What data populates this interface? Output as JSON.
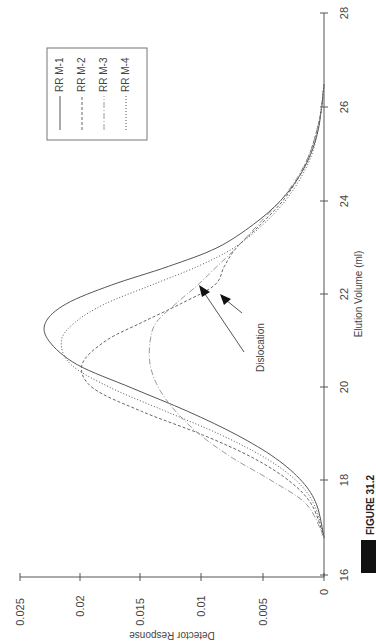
{
  "figure": {
    "caption_label": "FIGURE 31.2"
  },
  "chart_data": {
    "type": "line",
    "orientation": "rotated-90-clockwise",
    "title": "",
    "xlabel": "Elution Volume (ml)",
    "ylabel": "Detector Response",
    "xlim": [
      16,
      28
    ],
    "ylim": [
      0,
      0.025
    ],
    "x_ticks": [
      "16",
      "18",
      "20",
      "22",
      "24",
      "26",
      "28"
    ],
    "y_ticks": [
      "0",
      "0.005",
      "0.01",
      "0.015",
      "0.02",
      "0.025"
    ],
    "grid": false,
    "legend_position": "upper-right (rotated view: top-left box)",
    "legend": [
      "RR M-1",
      "RR M-2",
      "RR M-3",
      "RR M-4"
    ],
    "x": [
      16.8,
      17.5,
      18.0,
      18.5,
      19.0,
      19.5,
      20.0,
      20.5,
      21.0,
      21.4,
      21.8,
      22.2,
      22.6,
      23.0,
      23.5,
      24.0,
      24.5,
      25.0,
      25.5,
      26.0,
      26.5
    ],
    "series": [
      {
        "name": "RR M-1",
        "style": "solid",
        "color": "#555555",
        "values": [
          0.0,
          0.0006,
          0.0018,
          0.004,
          0.0072,
          0.0112,
          0.0158,
          0.0203,
          0.0226,
          0.0229,
          0.0212,
          0.0175,
          0.0128,
          0.0088,
          0.0058,
          0.0036,
          0.0021,
          0.0011,
          0.0005,
          0.0002,
          0.0
        ]
      },
      {
        "name": "RR M-2",
        "style": "dashed",
        "color": "#666666",
        "values": [
          0.0,
          0.001,
          0.0028,
          0.0058,
          0.01,
          0.015,
          0.019,
          0.0199,
          0.018,
          0.015,
          0.0118,
          0.009,
          0.0082,
          0.0072,
          0.0052,
          0.0034,
          0.0021,
          0.0012,
          0.0006,
          0.0002,
          0.0
        ]
      },
      {
        "name": "RR M-3",
        "style": "dash-dot-light",
        "color": "#9a9a9a",
        "values": [
          0.0,
          0.0014,
          0.0042,
          0.0075,
          0.0102,
          0.0122,
          0.0136,
          0.0143,
          0.0143,
          0.0138,
          0.0122,
          0.0104,
          0.0088,
          0.0072,
          0.0054,
          0.0036,
          0.0022,
          0.0012,
          0.0006,
          0.0002,
          0.0
        ]
      },
      {
        "name": "RR M-4",
        "style": "dotted",
        "color": "#555555",
        "values": [
          0.0,
          0.0008,
          0.0022,
          0.0048,
          0.0085,
          0.013,
          0.0175,
          0.0208,
          0.0216,
          0.0205,
          0.018,
          0.0142,
          0.0104,
          0.0074,
          0.005,
          0.0032,
          0.0019,
          0.001,
          0.0005,
          0.0002,
          0.0
        ]
      }
    ],
    "annotations": [
      {
        "text": "Dislocation",
        "points_to": [
          {
            "x": 22.1,
            "y": 0.0102,
            "series": "RR M-3"
          },
          {
            "x": 22.2,
            "y": 0.0084,
            "series": "RR M-2"
          }
        ]
      }
    ]
  }
}
